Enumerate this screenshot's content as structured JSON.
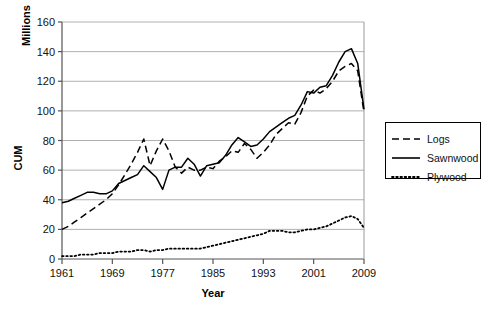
{
  "chart_data": {
    "type": "line",
    "title": "",
    "xlabel": "Year",
    "ylabel": "CUM",
    "units_label": "Millions",
    "xlim": [
      1961,
      2009
    ],
    "ylim": [
      0,
      160
    ],
    "ytick_labels": [
      "0",
      "20",
      "40",
      "60",
      "80",
      "100",
      "120",
      "140",
      "160"
    ],
    "ytick_values": [
      0,
      20,
      40,
      60,
      80,
      100,
      120,
      140,
      160
    ],
    "xtick_labels": [
      "1961",
      "1969",
      "1977",
      "1985",
      "1993",
      "2001",
      "2009"
    ],
    "xtick_values": [
      1961,
      1969,
      1977,
      1985,
      1993,
      2001,
      2009
    ],
    "grid": "horizontal",
    "legend_position": "right",
    "x": [
      1961,
      1962,
      1963,
      1964,
      1965,
      1966,
      1967,
      1968,
      1969,
      1970,
      1971,
      1972,
      1973,
      1974,
      1975,
      1976,
      1977,
      1978,
      1979,
      1980,
      1981,
      1982,
      1983,
      1984,
      1985,
      1986,
      1987,
      1988,
      1989,
      1990,
      1991,
      1992,
      1993,
      1994,
      1995,
      1996,
      1997,
      1998,
      1999,
      2000,
      2001,
      2002,
      2003,
      2004,
      2005,
      2006,
      2007,
      2008,
      2009
    ],
    "series": [
      {
        "name": "Logs",
        "style": "dashed",
        "color": "#000000",
        "values": [
          20,
          22,
          25,
          28,
          31,
          34,
          37,
          40,
          44,
          50,
          57,
          64,
          72,
          81,
          63,
          73,
          81,
          73,
          62,
          58,
          62,
          60,
          60,
          62,
          61,
          66,
          69,
          73,
          72,
          78,
          74,
          68,
          72,
          77,
          84,
          88,
          92,
          91,
          99,
          110,
          114,
          112,
          115,
          120,
          127,
          130,
          132,
          127,
          99
        ]
      },
      {
        "name": "Sawnwood",
        "style": "solid",
        "color": "#000000",
        "values": [
          38,
          39,
          41,
          43,
          45,
          45,
          44,
          44,
          46,
          51,
          53,
          55,
          57,
          63,
          59,
          55,
          47,
          60,
          62,
          62,
          68,
          64,
          56,
          63,
          64,
          65,
          70,
          77,
          82,
          79,
          76,
          77,
          81,
          86,
          89,
          92,
          95,
          97,
          104,
          113,
          112,
          116,
          117,
          124,
          133,
          140,
          142,
          132,
          101
        ]
      },
      {
        "name": "Plywood",
        "style": "dotted",
        "color": "#000000",
        "values": [
          2,
          2,
          2,
          3,
          3,
          3,
          4,
          4,
          4,
          5,
          5,
          5,
          6,
          6,
          5,
          6,
          6,
          7,
          7,
          7,
          7,
          7,
          7,
          8,
          9,
          10,
          11,
          12,
          13,
          14,
          15,
          16,
          17,
          19,
          19,
          19,
          18,
          18,
          19,
          20,
          20,
          21,
          22,
          24,
          26,
          28,
          29,
          27,
          21
        ]
      }
    ]
  },
  "legend": {
    "items": [
      {
        "label": "Logs"
      },
      {
        "label": "Sawnwood"
      },
      {
        "label": "Plywood"
      }
    ]
  }
}
